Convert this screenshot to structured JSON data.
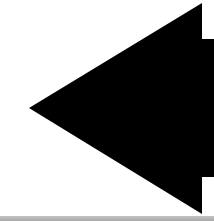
{
  "icon": {
    "name": "arrow-left-icon",
    "direction": "left",
    "fill_color": "#000000",
    "background_color": "#ffffff"
  },
  "bottom_strip": {
    "color": "#b4b4b4"
  }
}
